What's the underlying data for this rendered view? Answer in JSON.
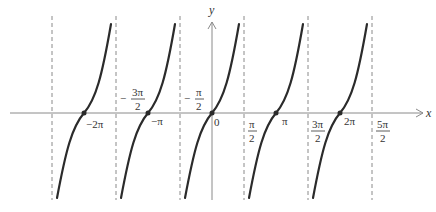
{
  "figure": {
    "type": "function-graph",
    "function": "tan x",
    "colors": {
      "curve": "#2b2b2b",
      "axis": "#8a8a8a",
      "asymptote": "#8a8a8a",
      "label": "#333333"
    }
  },
  "axes": {
    "x_label": "x",
    "y_label": "y"
  },
  "asymptote_labels": [
    {
      "sign": "−",
      "num": "3π",
      "den": "2"
    },
    {
      "sign": "−",
      "num": "π",
      "den": "2"
    },
    {
      "sign": "",
      "num": "π",
      "den": "2"
    },
    {
      "sign": "",
      "num": "3π",
      "den": "2"
    },
    {
      "sign": "",
      "num": "5π",
      "den": "2"
    }
  ],
  "zero_labels": [
    "−2π",
    "−π",
    "0",
    "π",
    "2π"
  ],
  "asymptotes": [
    "−5π/2",
    "−3π/2",
    "−π/2",
    "π/2",
    "3π/2",
    "5π/2"
  ],
  "branches": [
    {
      "between": [
        "−5π/2",
        "−3π/2"
      ],
      "zero": "−2π"
    },
    {
      "between": [
        "−3π/2",
        "−π/2"
      ],
      "zero": "−π"
    },
    {
      "between": [
        "−π/2",
        "π/2"
      ],
      "zero": "0"
    },
    {
      "between": [
        "π/2",
        "3π/2"
      ],
      "zero": "π"
    },
    {
      "between": [
        "3π/2",
        "5π/2"
      ],
      "zero": "2π"
    }
  ]
}
